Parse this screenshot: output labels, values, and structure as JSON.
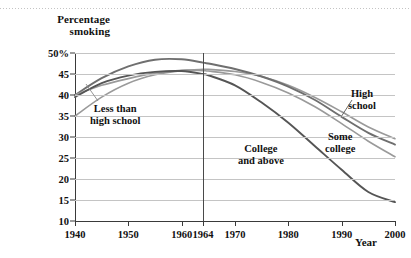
{
  "chart_data": {
    "type": "line",
    "title": "Percentage smoking",
    "xlabel": "Year",
    "ylabel": "Percentage smoking",
    "xlim": [
      1940,
      2000
    ],
    "ylim": [
      10,
      50
    ],
    "grid": true,
    "legend_position": "inline-annotations",
    "xticks": [
      "1940",
      "1950",
      "1960",
      "1964",
      "1970",
      "1980",
      "1990",
      "2000"
    ],
    "xtick_values": [
      1940,
      1950,
      1960,
      1964,
      1970,
      1980,
      1990,
      2000
    ],
    "yticks": [
      "50%",
      "45",
      "40",
      "35",
      "30",
      "25",
      "20",
      "15",
      "10"
    ],
    "ytick_values": [
      50,
      45,
      40,
      35,
      30,
      25,
      20,
      15,
      10
    ],
    "annotations": [
      {
        "name": "reference-line-1964",
        "type": "vline",
        "x": 1964,
        "color": "#4a4a4a"
      }
    ],
    "x": [
      1940,
      1945,
      1950,
      1955,
      1960,
      1964,
      1965,
      1970,
      1975,
      1980,
      1985,
      1990,
      1995,
      2000
    ],
    "series": [
      {
        "name": "Less than high school",
        "label": "Less than\nhigh school",
        "color": "#9a9a9a",
        "values": [
          35.0,
          39.5,
          42.8,
          44.8,
          45.8,
          46.1,
          46.1,
          45.6,
          44.4,
          42.3,
          39.4,
          36.0,
          32.4,
          29.6
        ]
      },
      {
        "name": "High school",
        "label": "High\nschool",
        "color": "#6f6f6f",
        "values": [
          40.0,
          44.0,
          46.8,
          48.4,
          48.5,
          47.7,
          47.5,
          46.2,
          44.4,
          42.0,
          38.8,
          34.8,
          31.0,
          28.2
        ]
      },
      {
        "name": "Some college",
        "label": "Some\ncollege",
        "color": "#9a9a9a",
        "values": [
          40.0,
          42.3,
          43.9,
          45.2,
          45.9,
          45.8,
          45.7,
          44.8,
          43.0,
          40.5,
          37.2,
          33.2,
          29.0,
          25.3
        ]
      },
      {
        "name": "College and above",
        "label": "College\nand above",
        "color": "#555555",
        "values": [
          39.5,
          42.8,
          44.6,
          45.5,
          45.7,
          45.0,
          44.7,
          42.3,
          38.2,
          33.4,
          27.8,
          22.2,
          16.9,
          14.5
        ]
      }
    ]
  },
  "labels": {
    "less_than_high_school_line1": "Less than",
    "less_than_high_school_line2": "high school",
    "high_school_line1": "High",
    "high_school_line2": "school",
    "some_college_line1": "Some",
    "some_college_line2": "college",
    "college_and_above_line1": "College",
    "college_and_above_line2": "and above",
    "axis_title_y_line1": "Percentage",
    "axis_title_y_line2": "smoking",
    "axis_title_x": "Year"
  }
}
